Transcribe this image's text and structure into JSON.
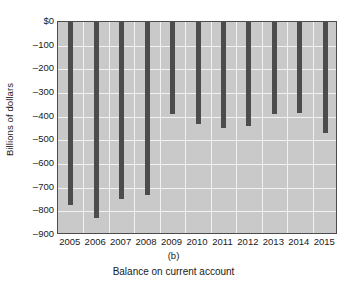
{
  "chart_data": {
    "type": "bar",
    "title": "Balance on current account",
    "panel_label": "(b)",
    "xlabel": "",
    "ylabel": "Billions of dollars",
    "categories": [
      "2005",
      "2006",
      "2007",
      "2008",
      "2009",
      "2010",
      "2011",
      "2012",
      "2013",
      "2014",
      "2015"
    ],
    "values": [
      -772,
      -827,
      -746,
      -730,
      -388,
      -430,
      -447,
      -439,
      -388,
      -384,
      -468
    ],
    "ylim": [
      -900,
      0
    ],
    "y_ticks": [
      0,
      -100,
      -200,
      -300,
      -400,
      -500,
      -600,
      -700,
      -800,
      -900
    ],
    "y_tick_labels": [
      "$0",
      "–100",
      "–200",
      "–300",
      "–400",
      "–500",
      "–600",
      "–700",
      "–800",
      "–900"
    ],
    "grid": true,
    "legend": false,
    "series_color": "#4c4c4c",
    "plot_background": "#c9c9c9",
    "gridline_color": "#f2f2f2",
    "axis_color": "#4c4c4c"
  }
}
